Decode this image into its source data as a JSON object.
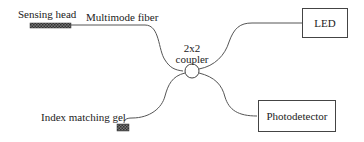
{
  "diagram": {
    "labels": {
      "sensing_head": "Sensing head",
      "multimode_fiber": "Multimode fiber",
      "coupler_line1": "2x2",
      "coupler_line2": "coupler",
      "index_matching_gel": "Index matching gel"
    },
    "boxes": {
      "led": "LED",
      "photodetector": "Photodetector"
    },
    "colors": {
      "line": "#555555",
      "box_border": "#444444",
      "hatch_fill": "#555555"
    }
  }
}
